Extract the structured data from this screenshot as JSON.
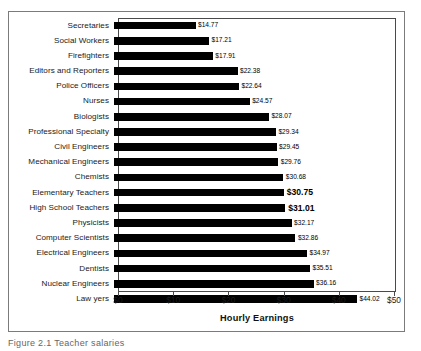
{
  "chart_data": {
    "type": "bar",
    "orientation": "horizontal",
    "title": "",
    "xlabel": "Hourly Earnings",
    "ylabel": "",
    "xlim": [
      0,
      50
    ],
    "xticks": [
      "$0",
      "$10",
      "$20",
      "$30",
      "$40",
      "$50"
    ],
    "xtick_values": [
      0,
      10,
      20,
      30,
      40,
      50
    ],
    "grid": false,
    "legend": false,
    "bar_color": "#000000",
    "highlight_color": "#000000",
    "categories": [
      "Secretaries",
      "Social Workers",
      "Firefighters",
      "Editors and Reporters",
      "Police Officers",
      "Nurses",
      "Biologists",
      "Professional Specialty",
      "Civil Engineers",
      "Mechanical Engineers",
      "Chemists",
      "Elementary Teachers",
      "High School Teachers",
      "Physicists",
      "Computer Scientists",
      "Electrical Engineers",
      "Dentists",
      "Nuclear Engineers",
      "Law yers"
    ],
    "values": [
      14.77,
      17.21,
      17.91,
      22.38,
      22.64,
      24.57,
      28.07,
      29.34,
      29.45,
      29.76,
      30.68,
      30.75,
      31.01,
      32.17,
      32.86,
      34.97,
      35.51,
      36.16,
      44.02
    ],
    "labels": [
      "$14.77",
      "$17.21",
      "$17.91",
      "$22.38",
      "$22.64",
      "$24.57",
      "$28.07",
      "$29.34",
      "$29.45",
      "$29.76",
      "$30.68",
      "$30.75",
      "$31.01",
      "$32.17",
      "$32.86",
      "$34.97",
      "$35.51",
      "$36.16",
      "$44.02"
    ],
    "highlighted": [
      false,
      false,
      false,
      false,
      false,
      false,
      false,
      false,
      false,
      false,
      false,
      true,
      true,
      false,
      false,
      false,
      false,
      false,
      false
    ]
  },
  "caption": "Figure 2.1    Teacher salaries"
}
